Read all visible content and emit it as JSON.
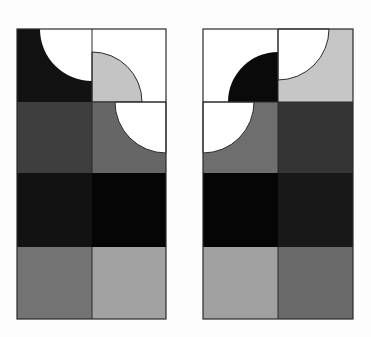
{
  "figure": {
    "colors": {
      "white": "#ffffff",
      "black": "#0a0a0a",
      "very_dark": "#1a1a1a",
      "dark": "#3c3c3c",
      "mid_dark": "#555555",
      "mid": "#6a6a6a",
      "mid_light": "#8a8a8a",
      "light": "#a4a4a4",
      "very_light": "#c4c4c4",
      "stroke": "#2a2a2a"
    },
    "panels": [
      {
        "name": "left-panel",
        "rows": [
          [
            {
              "fill": "#121212",
              "overlay": "white-quarter-top-right"
            },
            {
              "fill": "#ffffff",
              "overlay": "light-quarter-bottom-left"
            }
          ],
          [
            {
              "fill": "#3e3e3e"
            },
            {
              "fill": "#666666",
              "overlay": "white-quarter-top-right"
            }
          ],
          [
            {
              "fill": "#121212"
            },
            {
              "fill": "#050505"
            }
          ],
          [
            {
              "fill": "#737373"
            },
            {
              "fill": "#a2a2a2"
            }
          ]
        ]
      },
      {
        "name": "right-panel",
        "rows": [
          [
            {
              "fill": "#ffffff",
              "overlay": "black-quarter-bottom-right"
            },
            {
              "fill": "#c6c6c6",
              "overlay": "white-quarter-bottom-left"
            }
          ],
          [
            {
              "fill": "#6e6e6e",
              "overlay": "white-quarter-top-left-inverse"
            },
            {
              "fill": "#343434"
            }
          ],
          [
            {
              "fill": "#050505"
            },
            {
              "fill": "#181818"
            }
          ],
          [
            {
              "fill": "#a0a0a0"
            },
            {
              "fill": "#6a6a6a"
            }
          ]
        ]
      }
    ]
  }
}
